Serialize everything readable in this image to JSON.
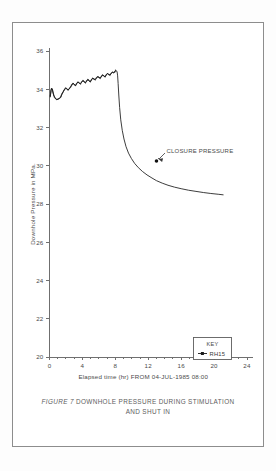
{
  "figure": {
    "caption_prefix": "FIGURE 7",
    "caption_line1": "DOWNHOLE PRESSURE DURING STIMULATION",
    "caption_line2": "AND SHUT IN"
  },
  "key": {
    "title": "KEY",
    "series_label": "RH15"
  },
  "annotation": {
    "label": "CLOSURE PRESSURE",
    "point_x": 13.0,
    "point_y": 30.25
  },
  "chart_data": {
    "type": "line",
    "title": "",
    "subtitle": "",
    "xlabel": "Elapsed time (hr) FROM 04-JUL-1985 08:00",
    "ylabel": "Downhole Pressure in MPa.",
    "xlim": [
      0,
      24
    ],
    "ylim": [
      20,
      36
    ],
    "xticks": [
      0,
      4,
      8,
      12,
      16,
      20,
      24
    ],
    "xtick_labels": [
      "0",
      "4",
      "8",
      "12",
      "16",
      "20",
      "24"
    ],
    "xminor_step": 1,
    "yticks": [
      20,
      22,
      24,
      26,
      28,
      30,
      32,
      34,
      36
    ],
    "ytick_labels": [
      "20",
      "22",
      "24",
      "26",
      "28",
      "30",
      "32",
      "34",
      "36"
    ],
    "grid": false,
    "legend_position": "bottom-right",
    "line_color": "#1a1a1a",
    "axis_color": "#6f6f6f",
    "series": [
      {
        "name": "RH15",
        "x": [
          0.1,
          0.18,
          0.26,
          0.34,
          0.42,
          0.5,
          0.62,
          0.75,
          0.9,
          1.05,
          1.2,
          1.35,
          1.5,
          1.65,
          1.8,
          1.95,
          2.1,
          2.25,
          2.4,
          2.55,
          2.7,
          2.85,
          3.0,
          3.15,
          3.3,
          3.45,
          3.6,
          3.75,
          3.9,
          4.05,
          4.2,
          4.35,
          4.5,
          4.65,
          4.8,
          4.95,
          5.1,
          5.25,
          5.4,
          5.55,
          5.7,
          5.85,
          6.0,
          6.15,
          6.3,
          6.45,
          6.6,
          6.75,
          6.9,
          7.05,
          7.2,
          7.35,
          7.5,
          7.65,
          7.8,
          7.95,
          8.05,
          8.15,
          8.22,
          8.28,
          8.34,
          8.42,
          8.52,
          8.66,
          8.84,
          9.05,
          9.3,
          9.6,
          9.95,
          10.35,
          10.8,
          11.3,
          11.85,
          12.45,
          13.0,
          13.7,
          14.4,
          15.2,
          16.0,
          16.9,
          17.8,
          18.7,
          19.6,
          20.5,
          21.1
        ],
        "y": [
          33.6,
          33.95,
          34.05,
          34.0,
          33.85,
          33.7,
          33.58,
          33.5,
          33.46,
          33.48,
          33.52,
          33.6,
          33.72,
          33.86,
          33.98,
          34.06,
          34.02,
          33.96,
          34.02,
          34.12,
          34.22,
          34.3,
          34.26,
          34.2,
          34.28,
          34.38,
          34.34,
          34.28,
          34.36,
          34.46,
          34.4,
          34.34,
          34.42,
          34.5,
          34.46,
          34.4,
          34.48,
          34.58,
          34.54,
          34.5,
          34.58,
          34.66,
          34.62,
          34.58,
          34.66,
          34.74,
          34.7,
          34.66,
          34.74,
          34.82,
          34.78,
          34.74,
          34.82,
          34.9,
          34.86,
          34.92,
          35.0,
          34.96,
          34.9,
          34.7,
          34.3,
          33.7,
          33.05,
          32.4,
          31.85,
          31.4,
          31.0,
          30.66,
          30.38,
          30.12,
          29.9,
          29.7,
          29.52,
          29.36,
          29.22,
          29.09,
          28.98,
          28.88,
          28.8,
          28.72,
          28.66,
          28.6,
          28.55,
          28.51,
          28.48
        ]
      }
    ]
  }
}
